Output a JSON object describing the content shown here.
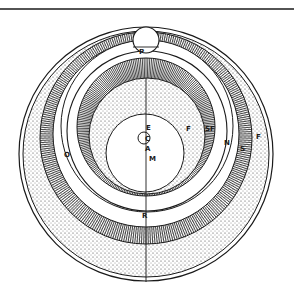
{
  "diagram": {
    "colors": {
      "ink": "#1a1a1a",
      "paper": "#ffffff",
      "stipple": "#3a3a3a"
    },
    "labels": {
      "P": "P",
      "E": "E",
      "C": "C",
      "A": "A",
      "M": "M",
      "F_inner": "F",
      "SF": "SF",
      "N": "N",
      "S": "S",
      "F_outer": "F",
      "O": "O",
      "R": "R"
    }
  }
}
